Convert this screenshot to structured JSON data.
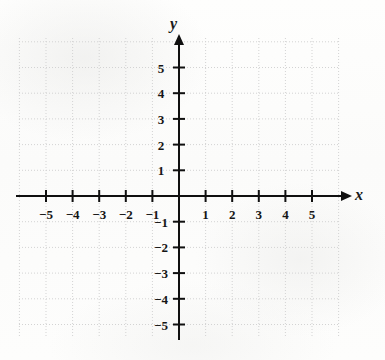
{
  "figure": {
    "kind": "cartesian-coordinate-grid",
    "background_color": "#fdfdfc",
    "axis_color": "#101010",
    "grid_color": "#d3d3d3",
    "label_color": "#151515"
  },
  "axes": {
    "x_label": "x",
    "y_label": "y",
    "x_arrow": true,
    "y_arrow": true
  },
  "chart_data": {
    "type": "scatter",
    "title": "",
    "subtitle": "",
    "xlabel": "x",
    "ylabel": "y",
    "xlim": [
      -6,
      6
    ],
    "ylim": [
      -6,
      6
    ],
    "grid": true,
    "grid_step": 1,
    "legend": null,
    "series": [
      {
        "name": "",
        "x": [],
        "y": []
      }
    ],
    "x_ticks": [
      -5,
      -4,
      -3,
      -2,
      -1,
      1,
      2,
      3,
      4,
      5
    ],
    "y_ticks": [
      -5,
      -4,
      -3,
      -2,
      -1,
      1,
      2,
      3,
      4,
      5
    ],
    "x_tick_labels": [
      "−5",
      "−4",
      "−3",
      "−2",
      "−1",
      "1",
      "2",
      "3",
      "4",
      "5"
    ],
    "y_tick_labels": [
      "−5",
      "−4",
      "−3",
      "−2",
      "−1",
      "1",
      "2",
      "3",
      "4",
      "5"
    ],
    "annotations": []
  },
  "geometry": {
    "origin_x": 179,
    "origin_y": 196,
    "unit_x": 26.6,
    "unit_y": 25.7,
    "grid_left": 19,
    "grid_right": 338,
    "grid_top": 38,
    "grid_bottom": 337
  }
}
